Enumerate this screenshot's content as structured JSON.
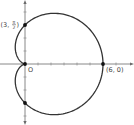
{
  "chart_data": {
    "type": "line",
    "title": "",
    "xlabel": "",
    "ylabel": "",
    "coordinate_system": "polar",
    "equation": "r = 3 + 3cos(θ)",
    "xlim": [
      -1,
      8
    ],
    "ylim": [
      -4.8,
      4.8
    ],
    "grid": false,
    "series": [
      {
        "name": "cardioid",
        "a": 3,
        "b": 3,
        "theta_range": [
          0,
          6.2832
        ]
      }
    ],
    "points": [
      {
        "name": "point-6-0",
        "r": 6,
        "theta": 0,
        "label": "(6, 0)"
      },
      {
        "name": "point-3-pi-over-2",
        "r": 3,
        "theta": 1.5708,
        "label_prefix": "(3,",
        "label_num": "π",
        "label_den": "2",
        "label_suffix": ")"
      },
      {
        "name": "point-origin",
        "r": 0,
        "theta": 0,
        "label": "O"
      },
      {
        "name": "point-3-3pi-over-2",
        "r": 3,
        "theta": 4.7124,
        "label": ""
      }
    ],
    "x_ticks": [
      1,
      2,
      3,
      4,
      5,
      6,
      7
    ],
    "y_ticks": [
      -4,
      -3,
      -2,
      -1,
      1,
      2,
      3,
      4
    ]
  }
}
